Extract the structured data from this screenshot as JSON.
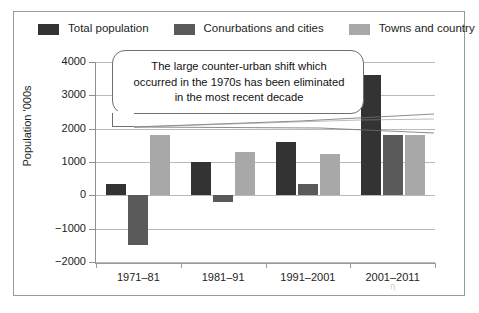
{
  "legend": {
    "items": [
      {
        "label": "Total population",
        "color": "#333333",
        "key": "total-population"
      },
      {
        "label": "Conurbations and cities",
        "color": "#5a5a5a",
        "key": "conurbations-and-cities"
      },
      {
        "label": "Towns and country",
        "color": "#a8a8a8",
        "key": "towns-and-country"
      }
    ]
  },
  "callout": {
    "line1": "The large counter-urban shift which",
    "line2": "occurred in the 1970s has been eliminated",
    "line3": "in the most recent decade"
  },
  "artifact": {
    "mark": "η"
  },
  "chart_data": {
    "type": "bar",
    "title": "",
    "xlabel": "",
    "ylabel": "Population '000s",
    "categories": [
      "1971–81",
      "1981–91",
      "1991–2001",
      "2001–2011"
    ],
    "series": [
      {
        "name": "Total population",
        "color": "#333333",
        "values": [
          350,
          1000,
          1600,
          3600
        ]
      },
      {
        "name": "Conurbations and cities",
        "color": "#5a5a5a",
        "values": [
          -1500,
          -200,
          350,
          1800
        ]
      },
      {
        "name": "Towns and country",
        "color": "#a8a8a8",
        "values": [
          1800,
          1300,
          1250,
          1800
        ]
      }
    ],
    "ylim": [
      -2000,
      4000
    ],
    "yticks": [
      4000,
      3000,
      2000,
      1000,
      0,
      -1000,
      -2000
    ],
    "ytick_labels": [
      "4000",
      "3000",
      "2000",
      "1000",
      "0",
      "−1000",
      "−2000"
    ],
    "grid": true,
    "legend_position": "top",
    "annotations": [
      "The large counter-urban shift which occurred in the 1970s has been eliminated in the most recent decade"
    ]
  }
}
